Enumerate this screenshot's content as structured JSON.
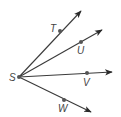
{
  "diagram": {
    "type": "geometry-rays",
    "vertex": {
      "label": "S",
      "x": 19,
      "y": 77,
      "label_x": 9,
      "label_y": 81
    },
    "rays": [
      {
        "name": "ST",
        "point": {
          "label": "T",
          "x": 60,
          "y": 31
        },
        "label_pos": {
          "x": 50,
          "y": 32
        },
        "tip": {
          "x": 81,
          "y": 11
        }
      },
      {
        "name": "SU",
        "point": {
          "label": "U",
          "x": 81,
          "y": 42
        },
        "label_pos": {
          "x": 77,
          "y": 54
        },
        "tip": {
          "x": 102,
          "y": 30
        }
      },
      {
        "name": "SV",
        "point": {
          "label": "V",
          "x": 87,
          "y": 73
        },
        "label_pos": {
          "x": 83,
          "y": 86
        },
        "tip": {
          "x": 112,
          "y": 72
        }
      },
      {
        "name": "SW",
        "point": {
          "label": "W",
          "x": 64,
          "y": 100
        },
        "label_pos": {
          "x": 58,
          "y": 112
        },
        "tip": {
          "x": 91,
          "y": 112
        }
      }
    ],
    "colors": {
      "line": "#3a3a3a",
      "point": "#555555",
      "label": "#444444"
    }
  }
}
